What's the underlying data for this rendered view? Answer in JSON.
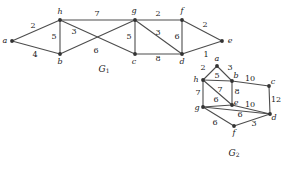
{
  "figure": {
    "background_color": "#ffffff",
    "edge_color": "#4d4d4d",
    "vertex_color": "#333333",
    "text_color": "#1a1a1a"
  },
  "chart_data": {
    "type": "diagram",
    "subtype": "weighted-undirected-graph",
    "title": "",
    "graphs": [
      {
        "id": "G1",
        "caption": "G",
        "caption_subscript": "1",
        "caption_pos": {
          "x": 104,
          "y": 69
        },
        "nodes": [
          {
            "id": "a",
            "label": "a",
            "x": 12,
            "y": 41,
            "label_x": 5,
            "label_y": 41
          },
          {
            "id": "b",
            "label": "b",
            "x": 60,
            "y": 54,
            "label_x": 60,
            "label_y": 62
          },
          {
            "id": "h",
            "label": "h",
            "x": 60,
            "y": 20,
            "label_x": 60,
            "label_y": 12
          },
          {
            "id": "c",
            "label": "c",
            "x": 135,
            "y": 54,
            "label_x": 134,
            "label_y": 62
          },
          {
            "id": "g",
            "label": "g",
            "x": 135,
            "y": 20,
            "label_x": 134,
            "label_y": 11
          },
          {
            "id": "d",
            "label": "d",
            "x": 182,
            "y": 54,
            "label_x": 182,
            "label_y": 62
          },
          {
            "id": "f",
            "label": "f",
            "x": 182,
            "y": 20,
            "label_x": 182,
            "label_y": 11
          },
          {
            "id": "e",
            "label": "e",
            "x": 222,
            "y": 41,
            "label_x": 230,
            "label_y": 41
          }
        ],
        "edges": [
          {
            "from": "a",
            "to": "h",
            "weight": "2",
            "label_x": 33,
            "label_y": 26
          },
          {
            "from": "a",
            "to": "b",
            "weight": "4",
            "label_x": 35,
            "label_y": 55
          },
          {
            "from": "h",
            "to": "b",
            "weight": "5",
            "label_x": 54,
            "label_y": 37
          },
          {
            "from": "h",
            "to": "g",
            "weight": "7",
            "label_x": 97,
            "label_y": 14
          },
          {
            "from": "h",
            "to": "c",
            "weight": "3",
            "label_x": 74,
            "label_y": 32
          },
          {
            "from": "b",
            "to": "g",
            "weight": "6",
            "label_x": 96,
            "label_y": 51
          },
          {
            "from": "g",
            "to": "c",
            "weight": "5",
            "label_x": 129,
            "label_y": 37
          },
          {
            "from": "g",
            "to": "f",
            "weight": "2",
            "label_x": 158,
            "label_y": 14
          },
          {
            "from": "g",
            "to": "d",
            "weight": "3",
            "label_x": 158,
            "label_y": 33
          },
          {
            "from": "c",
            "to": "d",
            "weight": "8",
            "label_x": 158,
            "label_y": 59
          },
          {
            "from": "f",
            "to": "d",
            "weight": "6",
            "label_x": 177,
            "label_y": 37
          },
          {
            "from": "f",
            "to": "e",
            "weight": "2",
            "label_x": 205,
            "label_y": 25
          },
          {
            "from": "d",
            "to": "e",
            "weight": "1",
            "label_x": 206,
            "label_y": 55
          }
        ]
      },
      {
        "id": "G2",
        "caption": "G",
        "caption_subscript": "2",
        "caption_pos": {
          "x": 234,
          "y": 153
        },
        "nodes": [
          {
            "id": "a",
            "label": "a",
            "x": 217,
            "y": 66,
            "label_x": 217,
            "label_y": 59
          },
          {
            "id": "h",
            "label": "h",
            "x": 203,
            "y": 80,
            "label_x": 196,
            "label_y": 80
          },
          {
            "id": "b",
            "label": "b",
            "x": 232,
            "y": 81,
            "label_x": 236,
            "label_y": 76
          },
          {
            "id": "c",
            "label": "c",
            "x": 269,
            "y": 86,
            "label_x": 273,
            "label_y": 82
          },
          {
            "id": "g",
            "label": "g",
            "x": 203,
            "y": 107,
            "label_x": 197,
            "label_y": 108
          },
          {
            "id": "e",
            "label": "e",
            "x": 232,
            "y": 105,
            "label_x": 236,
            "label_y": 103
          },
          {
            "id": "d",
            "label": "d",
            "x": 270,
            "y": 114,
            "label_x": 274,
            "label_y": 118
          },
          {
            "id": "f",
            "label": "f",
            "x": 234,
            "y": 126,
            "label_x": 234,
            "label_y": 133
          }
        ],
        "edges": [
          {
            "from": "h",
            "to": "a",
            "weight": "2",
            "label_x": 203,
            "label_y": 68
          },
          {
            "from": "a",
            "to": "b",
            "weight": "3",
            "label_x": 230,
            "label_y": 68
          },
          {
            "from": "h",
            "to": "b",
            "weight": "5",
            "label_x": 217,
            "label_y": 76
          },
          {
            "from": "b",
            "to": "c",
            "weight": "10",
            "label_x": 250,
            "label_y": 79
          },
          {
            "from": "h",
            "to": "g",
            "weight": "7",
            "label_x": 198,
            "label_y": 93
          },
          {
            "from": "h",
            "to": "e",
            "weight": "7",
            "label_x": 220,
            "label_y": 90
          },
          {
            "from": "b",
            "to": "e",
            "weight": "8",
            "label_x": 237,
            "label_y": 92
          },
          {
            "from": "c",
            "to": "d",
            "weight": "12",
            "label_x": 276,
            "label_y": 100
          },
          {
            "from": "g",
            "to": "e",
            "weight": "6",
            "label_x": 216,
            "label_y": 100
          },
          {
            "from": "e",
            "to": "d",
            "weight": "10",
            "label_x": 250,
            "label_y": 105
          },
          {
            "from": "g",
            "to": "f",
            "weight": "6",
            "label_x": 215,
            "label_y": 123
          },
          {
            "from": "g",
            "to": "d",
            "weight": "6",
            "label_x": 240,
            "label_y": 115
          },
          {
            "from": "f",
            "to": "d",
            "weight": "3",
            "label_x": 254,
            "label_y": 124
          }
        ]
      }
    ]
  }
}
